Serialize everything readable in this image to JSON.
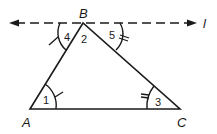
{
  "diagram": {
    "type": "triangle-with-parallel-line",
    "vertices": {
      "A": "A",
      "B": "B",
      "C": "C"
    },
    "line_label": "l",
    "angles": {
      "a1": "1",
      "a2": "2",
      "a3": "3",
      "a4": "4",
      "a5": "5"
    },
    "colors": {
      "stroke": "#1a1a1a",
      "background": "#ffffff"
    }
  }
}
